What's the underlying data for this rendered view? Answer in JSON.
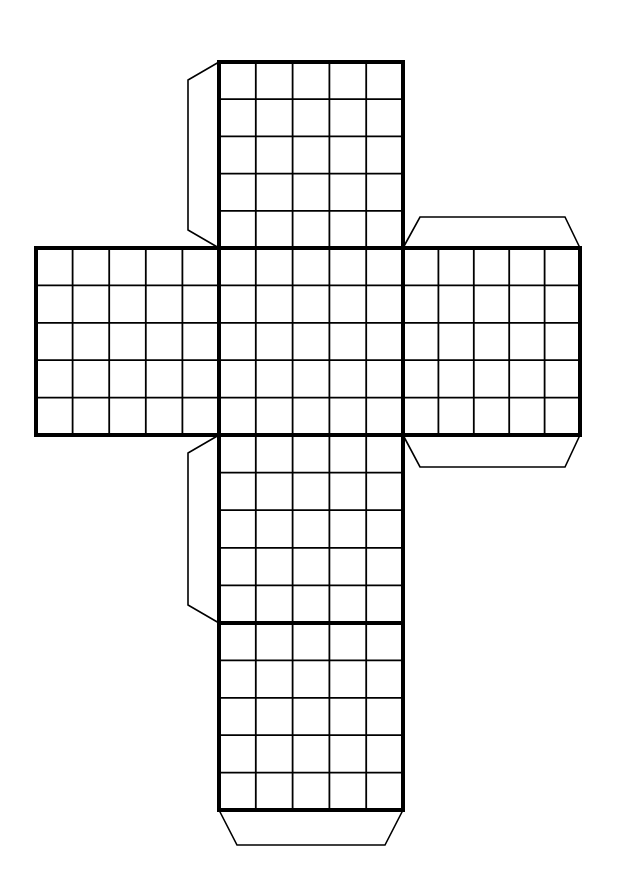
{
  "diagram": {
    "type": "cube-net",
    "grid_size": 5,
    "colors": {
      "line": "#000000",
      "background": "#ffffff"
    },
    "faces": [
      {
        "id": "top",
        "x": 219,
        "y": 62,
        "w": 184,
        "h": 186
      },
      {
        "id": "left",
        "x": 36,
        "y": 248,
        "w": 183,
        "h": 187
      },
      {
        "id": "center",
        "x": 219,
        "y": 248,
        "w": 184,
        "h": 187
      },
      {
        "id": "right",
        "x": 403,
        "y": 248,
        "w": 177,
        "h": 187
      },
      {
        "id": "lower",
        "x": 219,
        "y": 435,
        "w": 184,
        "h": 188
      },
      {
        "id": "bottom",
        "x": 219,
        "y": 623,
        "w": 184,
        "h": 187
      }
    ],
    "tabs": [
      {
        "id": "tab-top-left",
        "points": "219,62 188,80 188,230 219,248"
      },
      {
        "id": "tab-right-top",
        "points": "403,248 420,217 565,217 580,248"
      },
      {
        "id": "tab-right-bottom",
        "points": "403,435 420,467 565,467 580,435"
      },
      {
        "id": "tab-lower-left",
        "points": "219,435 188,453 188,605 219,623"
      },
      {
        "id": "tab-bottom",
        "points": "219,810 237,845 385,845 403,810"
      }
    ]
  }
}
